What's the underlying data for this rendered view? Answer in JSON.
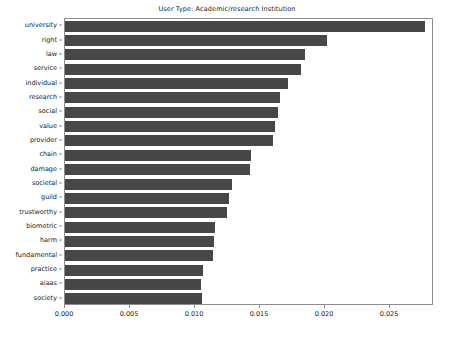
{
  "chart_data": {
    "type": "bar",
    "orientation": "horizontal",
    "title": "User Type: Academic/research Institution",
    "xlabel": "",
    "ylabel": "",
    "grid": false,
    "legend": null,
    "xlim": [
      0.0,
      0.02838
    ],
    "xticks": [
      0.0,
      0.005,
      0.01,
      0.015,
      0.02,
      0.025
    ],
    "xticklabels": [
      "0.000",
      "0.005",
      "0.010",
      "0.015",
      "0.020",
      "0.025"
    ],
    "bar_color": "#474747",
    "axes_color": "#8c8c8c",
    "text_color": "#1a1a1a",
    "background": "#ffffff",
    "categories": [
      "university",
      "right",
      "law",
      "service",
      "individual",
      "research",
      "social",
      "value",
      "provider",
      "chain",
      "damage",
      "societal",
      "guild",
      "trustworthy",
      "biometric",
      "harm",
      "fundamental",
      "practice",
      "aiaas",
      "society"
    ],
    "values": [
      0.0277,
      0.02015,
      0.01846,
      0.01815,
      0.01715,
      0.01654,
      0.01638,
      0.01615,
      0.016,
      0.01431,
      0.01423,
      0.01285,
      0.01262,
      0.01246,
      0.01154,
      0.01146,
      0.01138,
      0.01062,
      0.01046,
      0.01054
    ]
  }
}
